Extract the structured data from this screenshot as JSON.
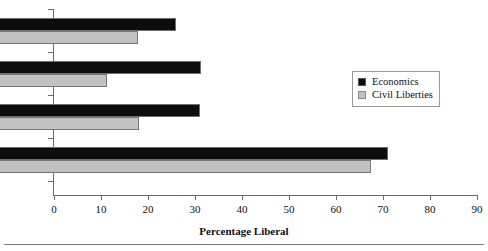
{
  "chart_data": {
    "type": "bar",
    "orientation": "horizontal",
    "title": "",
    "xlabel": "Percentage Liberal",
    "ylabel": "",
    "xlim": [
      0,
      90
    ],
    "xticks": [
      0,
      10,
      20,
      30,
      40,
      50,
      60,
      70,
      80,
      90
    ],
    "grid": false,
    "legend_position": "upper right",
    "categories": [
      "Roberts",
      "Rehnquist",
      "Burger",
      "Warren"
    ],
    "series": [
      {
        "name": "Economics",
        "color": "#0d0d0d",
        "values": [
          37.4,
          42.8,
          42.5,
          82.5
        ]
      },
      {
        "name": "Civil Liberties",
        "color": "#c2c2c2",
        "values": [
          29.4,
          22.8,
          29.6,
          78.9
        ]
      }
    ]
  },
  "axis": {
    "x_title": "Percentage Liberal",
    "tick_labels": [
      "0",
      "10",
      "20",
      "30",
      "40",
      "50",
      "60",
      "70",
      "80",
      "90"
    ]
  },
  "categories": [
    {
      "label": "Roberts"
    },
    {
      "label": "Rehnquist"
    },
    {
      "label": "Burger"
    },
    {
      "label": "Warren"
    }
  ],
  "legend": {
    "items": [
      {
        "label": "Economics",
        "swatch": "black-square-icon"
      },
      {
        "label": "Civil Liberties",
        "swatch": "gray-square-icon"
      }
    ]
  }
}
